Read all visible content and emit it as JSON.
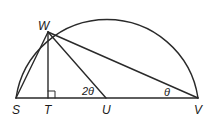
{
  "diagram": {
    "type": "semicircle geometry figure",
    "points": {
      "S": "S",
      "T": "T",
      "U": "U",
      "V": "V",
      "W": "W"
    },
    "angle_labels": {
      "at_U": "2θ",
      "at_V": "θ"
    },
    "right_angle_at": "T",
    "segments": [
      "SV",
      "WS",
      "WT",
      "WU",
      "WV"
    ],
    "arc": "semicircle over SV centered at U"
  }
}
